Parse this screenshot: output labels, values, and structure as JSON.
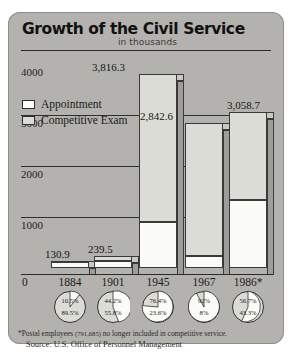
{
  "header": {
    "title": "Growth of the Civil Service",
    "subtitle": "in thousands"
  },
  "legend": {
    "items": [
      {
        "label": "Appointment",
        "color": "#fbfbf8"
      },
      {
        "label": "Competitive Exam",
        "color": "#dcdcd6"
      }
    ]
  },
  "footnotes": {
    "asterisk_pre": "*Postal employees",
    "asterisk_number": "(791,685)",
    "asterisk_post": "no longer included in competitive service.",
    "source": "Source: U.S. Office of Personnel Management"
  },
  "chart_data": {
    "type": "bar",
    "title": "Growth of the Civil Service",
    "subtitle": "in thousands",
    "xlabel": "",
    "ylabel": "in thousands",
    "ylim": [
      0,
      4200
    ],
    "yticks": [
      "0",
      "1000",
      "2000",
      "3000",
      "4000"
    ],
    "grid": true,
    "legend_position": "inside-left",
    "categories": [
      "1884",
      "1901",
      "1945",
      "1967",
      "1986*"
    ],
    "values": [
      130.9,
      239.5,
      3816.3,
      2842.6,
      3058.7
    ],
    "value_labels": [
      "130.9",
      "239.5",
      "3,816.3",
      "2,842.6",
      "3,058.7"
    ],
    "series": [
      {
        "name": "Appointment",
        "values": [
          117.1,
          133.6,
          900.6,
          227.4,
          1325.4
        ]
      },
      {
        "name": "Competitive Exam",
        "values": [
          13.8,
          105.9,
          2915.7,
          2615.2,
          1733.3
        ]
      }
    ],
    "pies": {
      "title": "Share by category",
      "type": "pie",
      "charts": [
        {
          "year": "1884",
          "appointment_pct": "10.5%",
          "competitive_pct": "89.5%",
          "appointment_value": 10.5
        },
        {
          "year": "1901",
          "appointment_pct": "44.2%",
          "competitive_pct": "55.8%",
          "appointment_value": 44.2
        },
        {
          "year": "1945",
          "appointment_pct": "76.4%",
          "competitive_pct": "23.6%",
          "appointment_value": 76.4
        },
        {
          "year": "1967",
          "appointment_pct": "92%",
          "competitive_pct": "8%",
          "appointment_value": 92
        },
        {
          "year": "1986",
          "appointment_pct": "56.7%",
          "competitive_pct": "43.3%",
          "appointment_value": 56.7
        }
      ]
    }
  }
}
